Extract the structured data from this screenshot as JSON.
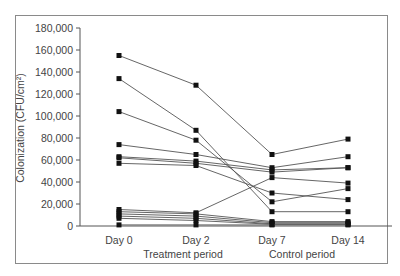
{
  "chart_data": {
    "type": "line",
    "title": "",
    "xlabel": "",
    "ylabel": "Colonization (CFU/cm²)",
    "categories": [
      "Day 0",
      "Day 2",
      "Day 7",
      "Day 14"
    ],
    "period_labels": [
      "Treatment period",
      "Control period"
    ],
    "y_ticks": [
      "0",
      "20,000",
      "40,000",
      "60,000",
      "80,000",
      "100,000",
      "120,000",
      "140,000",
      "160,000",
      "180,000"
    ],
    "ylim": [
      0,
      180000
    ],
    "grid": false,
    "legend": "none",
    "series": [
      {
        "name": "S1",
        "values": [
          155000,
          128000,
          65000,
          79000
        ]
      },
      {
        "name": "S2",
        "values": [
          134000,
          87000,
          13000,
          13000
        ]
      },
      {
        "name": "S3",
        "values": [
          104000,
          78000,
          22000,
          34000
        ]
      },
      {
        "name": "S4",
        "values": [
          74000,
          65000,
          53000,
          63000
        ]
      },
      {
        "name": "S5",
        "values": [
          63000,
          59000,
          51000,
          53000
        ]
      },
      {
        "name": "S6",
        "values": [
          62000,
          57000,
          49000,
          53000
        ]
      },
      {
        "name": "S7",
        "values": [
          57000,
          55000,
          30000,
          24000
        ]
      },
      {
        "name": "S8",
        "values": [
          15000,
          12000,
          44000,
          39000
        ]
      },
      {
        "name": "S9",
        "values": [
          13000,
          11000,
          4000,
          4000
        ]
      },
      {
        "name": "S10",
        "values": [
          11000,
          9000,
          3000,
          3000
        ]
      },
      {
        "name": "S11",
        "values": [
          9000,
          7000,
          2000,
          2000
        ]
      },
      {
        "name": "S12",
        "values": [
          7000,
          5000,
          1500,
          1500
        ]
      },
      {
        "name": "S13",
        "values": [
          1000,
          1000,
          1000,
          1000
        ]
      }
    ]
  }
}
